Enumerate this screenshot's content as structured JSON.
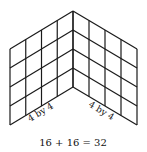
{
  "figure": {
    "left_panel": {
      "label": "4 by 4",
      "rows": 4,
      "cols": 4
    },
    "right_panel": {
      "label": "4 by 4",
      "rows": 4,
      "cols": 4
    },
    "equation": "16 + 16 = 32",
    "line_color": "#1a1a1a",
    "text_color": "#111111"
  }
}
